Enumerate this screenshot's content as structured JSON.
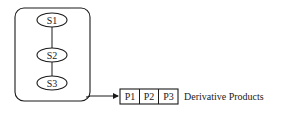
{
  "diagram": {
    "container": {
      "label": ""
    },
    "nodes": [
      {
        "id": "S1",
        "label": "S1",
        "cx": 52,
        "cy": 20
      },
      {
        "id": "S2",
        "label": "S2",
        "cx": 52,
        "cy": 55
      },
      {
        "id": "S3",
        "label": "S3",
        "cx": 52,
        "cy": 83
      }
    ],
    "edges": [
      {
        "from": "S1",
        "to": "S2"
      },
      {
        "from": "S2",
        "to": "S3"
      },
      {
        "from": "container",
        "to": "products",
        "arrow": true
      }
    ],
    "products": {
      "items": [
        {
          "label": "P1"
        },
        {
          "label": "P2"
        },
        {
          "label": "P3"
        }
      ],
      "caption": "Derivative Products"
    },
    "colors": {
      "stroke": "#1a1a1a",
      "background": "#ffffff"
    }
  }
}
